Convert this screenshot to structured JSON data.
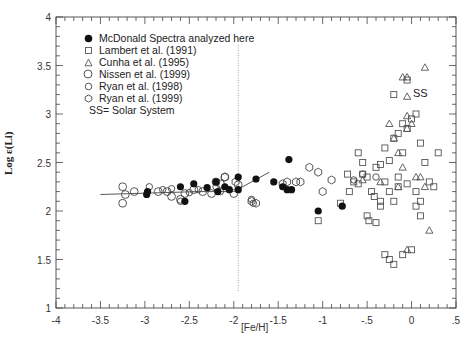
{
  "chart_data": {
    "type": "scatter",
    "title": "",
    "xlabel": "[Fe/H]",
    "ylabel": "Log ε(Li)",
    "xlim": [
      -4,
      0.5
    ],
    "ylim": [
      1,
      4
    ],
    "x_ticks": [
      "-4",
      "-3.5",
      "-3",
      "-2.5",
      "-2",
      "-1.5",
      "-1",
      "-.5",
      "0",
      ".5"
    ],
    "y_ticks": [
      "1",
      "1.5",
      "2",
      "2.5",
      "3",
      "3.5",
      "4"
    ],
    "grid": false,
    "legend_position": "upper left",
    "annotations": [
      {
        "text": "SS",
        "x": 0.05,
        "y": 3.1,
        "meaning": "Solar System"
      },
      {
        "type": "vertical-dotted-line",
        "x": -1.95
      }
    ],
    "trend_lines": [
      {
        "name": "Spite plateau fit",
        "points": [
          [
            -3.5,
            2.17
          ],
          [
            -2.4,
            2.2
          ],
          [
            -2.0,
            2.2
          ],
          [
            -1.6,
            2.4
          ]
        ]
      }
    ],
    "series": [
      {
        "name": "McDonald Spectra analyzed here",
        "marker": "filled-circle",
        "points": [
          [
            -2.98,
            2.17
          ],
          [
            -2.97,
            2.2
          ],
          [
            -2.6,
            2.25
          ],
          [
            -2.55,
            2.1
          ],
          [
            -2.45,
            2.28
          ],
          [
            -2.3,
            2.24
          ],
          [
            -2.2,
            2.3
          ],
          [
            -2.18,
            2.2
          ],
          [
            -2.1,
            2.25
          ],
          [
            -2.05,
            2.22
          ],
          [
            -1.95,
            2.22
          ],
          [
            -1.95,
            2.35
          ],
          [
            -1.75,
            2.33
          ],
          [
            -1.55,
            2.3
          ],
          [
            -1.45,
            2.25
          ],
          [
            -1.4,
            2.22
          ],
          [
            -1.35,
            2.22
          ],
          [
            -1.38,
            2.53
          ],
          [
            -1.05,
            2.0
          ],
          [
            -0.78,
            2.05
          ]
        ]
      },
      {
        "name": "Lambert et al. (1991)",
        "marker": "open-square",
        "points": [
          [
            -1.05,
            1.9
          ],
          [
            -0.8,
            2.08
          ],
          [
            -0.72,
            2.38
          ],
          [
            -0.7,
            2.2
          ],
          [
            -0.65,
            2.3
          ],
          [
            -0.6,
            2.28
          ],
          [
            -0.55,
            2.38
          ],
          [
            -0.5,
            2.35
          ],
          [
            -0.45,
            2.2
          ],
          [
            -0.42,
            2.15
          ],
          [
            -0.5,
            1.95
          ],
          [
            -0.48,
            1.9
          ],
          [
            -0.4,
            1.88
          ],
          [
            -0.35,
            2.05
          ],
          [
            -0.3,
            2.3
          ],
          [
            -0.25,
            2.2
          ],
          [
            -0.2,
            2.1
          ],
          [
            -0.55,
            2.5
          ],
          [
            -0.6,
            2.6
          ],
          [
            -0.35,
            2.48
          ],
          [
            -0.25,
            2.52
          ],
          [
            -0.15,
            2.35
          ],
          [
            -0.1,
            2.6
          ],
          [
            -0.3,
            2.65
          ],
          [
            -0.2,
            2.75
          ],
          [
            -0.1,
            2.9
          ],
          [
            -0.05,
            2.85
          ],
          [
            0.0,
            2.95
          ],
          [
            0.05,
            3.0
          ],
          [
            -0.05,
            3.35
          ],
          [
            -0.2,
            3.2
          ],
          [
            -0.15,
            2.25
          ],
          [
            -0.05,
            2.28
          ],
          [
            0.05,
            2.2
          ],
          [
            0.1,
            2.1
          ],
          [
            0.15,
            2.5
          ],
          [
            0.25,
            2.25
          ],
          [
            -0.3,
            1.55
          ],
          [
            -0.25,
            1.5
          ],
          [
            -0.2,
            1.45
          ],
          [
            -0.1,
            1.55
          ],
          [
            0.0,
            1.6
          ],
          [
            0.05,
            2.05
          ],
          [
            0.1,
            1.95
          ],
          [
            0.2,
            2.3
          ],
          [
            0.3,
            2.6
          ],
          [
            0.1,
            2.7
          ],
          [
            -0.15,
            2.8
          ],
          [
            -0.4,
            2.45
          ],
          [
            -0.35,
            2.1
          ]
        ]
      },
      {
        "name": "Cunha et al. (1995)",
        "marker": "open-triangle",
        "points": [
          [
            -0.55,
            2.32
          ],
          [
            -0.35,
            2.3
          ],
          [
            -0.1,
            3.38
          ],
          [
            -0.05,
            3.38
          ],
          [
            -0.05,
            3.18
          ],
          [
            0.15,
            3.48
          ],
          [
            -0.05,
            2.98
          ],
          [
            -0.15,
            2.6
          ],
          [
            -0.05,
            2.85
          ],
          [
            0.0,
            2.9
          ],
          [
            -0.1,
            2.45
          ],
          [
            -0.15,
            2.25
          ],
          [
            0.05,
            2.35
          ],
          [
            0.1,
            2.35
          ],
          [
            0.15,
            2.25
          ],
          [
            0.2,
            1.8
          ],
          [
            -0.05,
            1.6
          ],
          [
            -0.2,
            2.75
          ],
          [
            -0.25,
            2.9
          ]
        ]
      },
      {
        "name": "Nissen et al. (1999)",
        "marker": "open-circle",
        "points": [
          [
            -3.25,
            2.25
          ],
          [
            -3.22,
            2.17
          ],
          [
            -3.25,
            2.08
          ],
          [
            -3.12,
            2.2
          ],
          [
            -2.85,
            2.2
          ],
          [
            -2.75,
            2.2
          ],
          [
            -2.7,
            2.15
          ],
          [
            -2.6,
            2.12
          ],
          [
            -2.55,
            2.18
          ],
          [
            -2.45,
            2.22
          ],
          [
            -2.35,
            2.2
          ],
          [
            -2.25,
            2.18
          ],
          [
            -2.2,
            2.3
          ],
          [
            -2.15,
            2.28
          ],
          [
            -2.1,
            2.35
          ],
          [
            -2.0,
            2.18
          ],
          [
            -1.95,
            2.27
          ]
        ]
      },
      {
        "name": "Ryan et al. (1998)",
        "marker": "open-circle-small",
        "points": [
          [
            -2.95,
            2.25
          ],
          [
            -2.8,
            2.22
          ],
          [
            -2.7,
            2.23
          ],
          [
            -2.6,
            2.1
          ],
          [
            -2.5,
            2.19
          ],
          [
            -2.4,
            2.22
          ],
          [
            -2.2,
            2.25
          ],
          [
            -2.15,
            2.2
          ],
          [
            -1.8,
            2.12
          ],
          [
            -1.78,
            2.08
          ],
          [
            -0.65,
            2.32
          ],
          [
            -0.55,
            2.38
          ],
          [
            -0.4,
            2.35
          ]
        ]
      },
      {
        "name": "Ryan et al. (1999)",
        "marker": "open-hexagon",
        "points": [
          [
            -2.1,
            2.35
          ],
          [
            -1.98,
            2.3
          ],
          [
            -1.8,
            2.1
          ],
          [
            -1.75,
            2.08
          ],
          [
            -1.45,
            2.28
          ],
          [
            -1.4,
            2.3
          ],
          [
            -1.3,
            2.3
          ],
          [
            -1.25,
            2.3
          ],
          [
            -1.15,
            2.45
          ],
          [
            -1.05,
            2.4
          ],
          [
            -1.0,
            2.2
          ],
          [
            -0.9,
            2.32
          ]
        ]
      }
    ]
  },
  "axis": {
    "y_label": "Log ε(Li)",
    "x_label": "[Fe/H]",
    "x_tick_labels": [
      "-4",
      "-3.5",
      "-3",
      "-2.5",
      "-2",
      "-1.5",
      "-1",
      "-.5",
      "0",
      ".5"
    ],
    "y_tick_labels": [
      "1",
      "1.5",
      "2",
      "2.5",
      "3",
      "3.5",
      "4"
    ]
  },
  "legend": {
    "items": [
      {
        "label": "McDonald Spectra analyzed here",
        "marker": "filled-circle"
      },
      {
        "label": "Lambert et al. (1991)",
        "marker": "open-square"
      },
      {
        "label": "Cunha et al. (1995)",
        "marker": "open-triangle"
      },
      {
        "label": "Nissen et al. (1999)",
        "marker": "open-circle"
      },
      {
        "label": "Ryan et al. (1998)",
        "marker": "open-circle-small"
      },
      {
        "label": "Ryan et al. (1999)",
        "marker": "open-hexagon"
      }
    ],
    "note": "SS= Solar System"
  },
  "annotation": {
    "ss_label": "SS"
  },
  "colors": {
    "axis": "#333333",
    "marker_fill": "#111111",
    "marker_open": "#555555",
    "trend_line": "#444444"
  }
}
